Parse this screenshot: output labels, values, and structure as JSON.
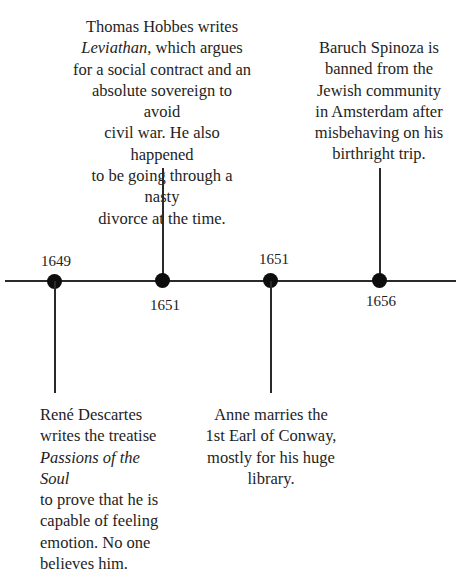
{
  "timeline": {
    "events": [
      {
        "year": "1649",
        "position": "below",
        "text_parts": [
          "René Descartes writes the treatise ",
          "Passions of the Soul",
          " to prove that he is capable of feeling emotion. No one believes him."
        ],
        "lines": [
          "René Descartes",
          "writes the treatise",
          "Passions of the Soul",
          "to prove that he is",
          "capable of feeling",
          "emotion. No one",
          "believes him."
        ]
      },
      {
        "year": "1651",
        "position": "above",
        "lines": [
          "Thomas Hobbes writes",
          "Leviathan, which argues",
          "for a social contract and an",
          "absolute sovereign to avoid",
          "civil war. He also happened",
          "to be going through a nasty",
          "divorce at the time."
        ]
      },
      {
        "year": "1651",
        "position": "below",
        "lines": [
          "Anne marries the",
          "1st Earl of Conway,",
          "mostly for his huge",
          "library."
        ]
      },
      {
        "year": "1656",
        "position": "above",
        "lines": [
          "Baruch Spinoza is",
          "banned from the",
          "Jewish community",
          "in Amsterdam after",
          "misbehaving on his",
          "birthright trip."
        ]
      }
    ],
    "italic_titles": {
      "leviathan": "Leviathan",
      "leviathan_rest": ", which argues",
      "passions": "Passions of the Soul"
    }
  }
}
